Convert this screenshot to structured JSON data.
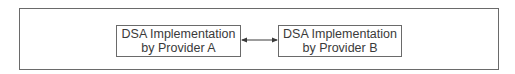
{
  "diagram": {
    "nodes": [
      {
        "id": "A",
        "line1": "DSA Implementation",
        "line2": "by Provider A"
      },
      {
        "id": "B",
        "line1": "DSA Implementation",
        "line2": "by Provider B"
      }
    ],
    "edges": [
      {
        "from": "A",
        "to": "B",
        "type": "bidirectional-arrow"
      }
    ],
    "colors": {
      "stroke": "#6a6a6a",
      "text": "#3a3a3a",
      "background": "#ffffff"
    }
  }
}
